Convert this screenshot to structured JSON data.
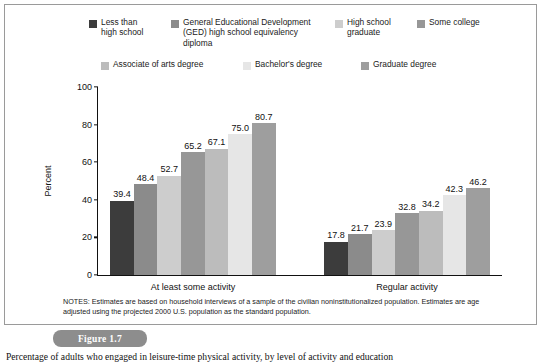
{
  "figure": {
    "tab_label": "Figure 1.7",
    "caption": "Percentage of adults who engaged in leisure-time physical activity, by level of activity and education",
    "notes": "NOTES: Estimates are based on household interviews of a sample of the civilian noninstitutionalized population. Estimates are age adjusted using the projected 2000 U.S. population as the standard population."
  },
  "chart_data": {
    "type": "bar",
    "title": "",
    "xlabel": "",
    "ylabel": "Percent",
    "ylim": [
      0,
      100
    ],
    "yticks": [
      0,
      20,
      40,
      60,
      80,
      100
    ],
    "grid": false,
    "legend_position": "top",
    "categories": [
      "At least some activity",
      "Regular activity"
    ],
    "series": [
      {
        "name": "Less than high school",
        "color": "#3c3c3c",
        "values": [
          39.4,
          17.8
        ]
      },
      {
        "name": "General Educational Development (GED) high school equivalency diploma",
        "color": "#8b8b8b",
        "values": [
          48.4,
          21.7
        ]
      },
      {
        "name": "High school graduate",
        "color": "#cdcdcd",
        "values": [
          52.7,
          23.9
        ]
      },
      {
        "name": "Some college",
        "color": "#979797",
        "values": [
          65.2,
          32.8
        ]
      },
      {
        "name": "Associate of arts degree",
        "color": "#bcbcbc",
        "values": [
          67.1,
          34.2
        ]
      },
      {
        "name": "Bachelor's degree",
        "color": "#e6e6e6",
        "values": [
          75.0,
          42.3
        ]
      },
      {
        "name": "Graduate degree",
        "color": "#9e9e9e",
        "values": [
          80.7,
          46.2
        ]
      }
    ],
    "value_labels": {
      "At least some activity": [
        "39.4",
        "48.4",
        "52.7",
        "65.2",
        "67.1",
        "75.0",
        "80.7"
      ],
      "Regular activity": [
        "17.8",
        "21.7",
        "23.9",
        "32.8",
        "34.2",
        "42.3",
        "46.2"
      ]
    }
  },
  "legend": {
    "row1": [
      {
        "label": "Less than\nhigh school",
        "color": "#3c3c3c",
        "left": 84,
        "width": 78
      },
      {
        "label": "General Educational Development\n(GED) high school equivalency\ndiploma",
        "color": "#8b8b8b",
        "left": 166,
        "width": 158
      },
      {
        "label": "High school\ngraduate",
        "color": "#cdcdcd",
        "left": 330,
        "width": 72
      },
      {
        "label": "Some college",
        "color": "#979797",
        "left": 412,
        "width": 80
      }
    ],
    "row2": [
      {
        "label": "Associate of arts degree",
        "color": "#bcbcbc",
        "left": 96,
        "width": 125
      },
      {
        "label": "Bachelor's degree",
        "color": "#e6e6e6",
        "left": 238,
        "width": 100
      },
      {
        "label": "Graduate degree",
        "color": "#9e9e9e",
        "left": 356,
        "width": 100
      }
    ]
  }
}
